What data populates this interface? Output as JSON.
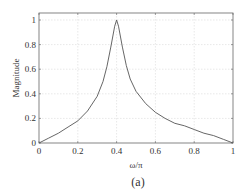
{
  "chart_data": {
    "type": "line",
    "title": "",
    "xlabel": "ω/π",
    "ylabel": "Magnitude",
    "caption": "(a)",
    "xlim": [
      0,
      1
    ],
    "ylim": [
      0,
      1.1
    ],
    "grid": true,
    "legend": null,
    "x_ticks": [
      0,
      0.2,
      0.4,
      0.6,
      0.8,
      1
    ],
    "x_tick_labels": [
      "0",
      "0.2",
      "0.4",
      "0.6",
      "0.8",
      "1"
    ],
    "y_ticks": [
      0,
      0.2,
      0.4,
      0.6,
      0.8,
      1
    ],
    "y_tick_labels": [
      "0",
      "0.2",
      "0.4",
      "0.6",
      "0.8",
      "1"
    ],
    "series": [
      {
        "name": "Magnitude response",
        "color": "#555555",
        "x": [
          0,
          0.05,
          0.1,
          0.15,
          0.2,
          0.25,
          0.3,
          0.33,
          0.35,
          0.37,
          0.39,
          0.4,
          0.41,
          0.43,
          0.45,
          0.47,
          0.5,
          0.55,
          0.6,
          0.65,
          0.7,
          0.75,
          0.8,
          0.85,
          0.9,
          0.95,
          1.0
        ],
        "y": [
          0,
          0.04,
          0.08,
          0.13,
          0.18,
          0.26,
          0.38,
          0.5,
          0.62,
          0.78,
          0.95,
          1.0,
          0.95,
          0.78,
          0.63,
          0.52,
          0.42,
          0.32,
          0.25,
          0.2,
          0.16,
          0.14,
          0.11,
          0.08,
          0.06,
          0.03,
          0
        ]
      }
    ]
  }
}
